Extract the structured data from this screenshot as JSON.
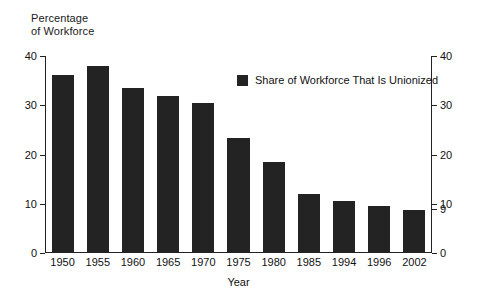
{
  "chart_data": {
    "type": "bar",
    "title": "",
    "subtitle": "",
    "ylabel": "Percentage\nof Workforce",
    "xlabel": "Year",
    "categories": [
      "1950",
      "1955",
      "1960",
      "1965",
      "1970",
      "1975",
      "1980",
      "1985",
      "1994",
      "1996",
      "2002"
    ],
    "values": [
      36.2,
      38.0,
      33.5,
      31.8,
      30.4,
      23.3,
      18.5,
      12.0,
      10.6,
      9.6,
      8.8
    ],
    "series": [
      {
        "name": "Share of Workforce That Is Unionized",
        "values": [
          36.2,
          38.0,
          33.5,
          31.8,
          30.4,
          23.3,
          18.5,
          12.0,
          10.6,
          9.6,
          8.8
        ]
      }
    ],
    "ylim": [
      0,
      40
    ],
    "y_ticks_left": [
      0,
      10,
      20,
      30,
      40
    ],
    "y_ticks_right": [
      0,
      9,
      10,
      20,
      30,
      40
    ],
    "grid": false,
    "legend": {
      "position": "top-right-inside",
      "entries": [
        {
          "label": "Share of Workforce That Is Unionized",
          "color": "#232323"
        }
      ]
    },
    "bar_color": "#232323",
    "axis_color": "#222222",
    "background": "#ffffff"
  },
  "axis": {
    "y_title": "Percentage\nof Workforce",
    "x_title": "Year",
    "left_ticks": [
      "40",
      "30",
      "20",
      "10",
      "0"
    ],
    "right_ticks": [
      "40",
      "30",
      "20",
      "10",
      "9",
      "0"
    ]
  },
  "legend": {
    "swatch_color": "#232323",
    "label": "Share of Workforce That Is Unionized"
  }
}
